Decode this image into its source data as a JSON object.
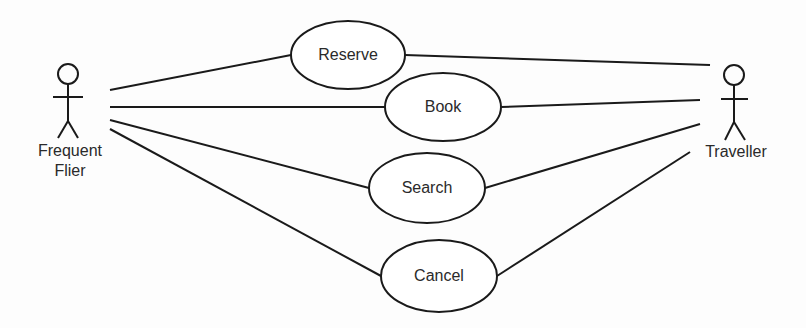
{
  "diagram": {
    "type": "use-case",
    "actors": [
      {
        "id": "frequent-flier",
        "label_line1": "Frequent",
        "label_line2": "Flier"
      },
      {
        "id": "traveller",
        "label": "Traveller"
      }
    ],
    "use_cases": [
      {
        "id": "reserve",
        "label": "Reserve"
      },
      {
        "id": "book",
        "label": "Book"
      },
      {
        "id": "search",
        "label": "Search"
      },
      {
        "id": "cancel",
        "label": "Cancel"
      }
    ],
    "associations": [
      [
        "frequent-flier",
        "reserve"
      ],
      [
        "frequent-flier",
        "book"
      ],
      [
        "frequent-flier",
        "search"
      ],
      [
        "frequent-flier",
        "cancel"
      ],
      [
        "traveller",
        "reserve"
      ],
      [
        "traveller",
        "book"
      ],
      [
        "traveller",
        "search"
      ],
      [
        "traveller",
        "cancel"
      ]
    ],
    "stroke_color": "#1a1a1a"
  }
}
